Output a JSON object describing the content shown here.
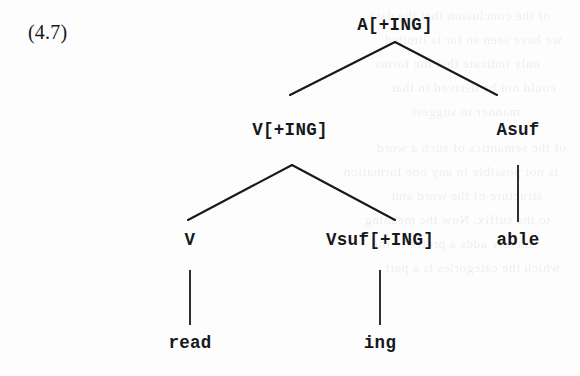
{
  "figure": {
    "number_label": "(4.7)",
    "kind": "syntactic-tree-diagram",
    "ink_color": "#16181a",
    "page_color": "#fdfdfd"
  },
  "tree": {
    "nodes": [
      {
        "id": "root",
        "label": "A[+ING]",
        "x": 395,
        "y": 25,
        "level": 0,
        "role": "root-category"
      },
      {
        "id": "v1",
        "label": "V[+ING]",
        "x": 290,
        "y": 130,
        "level": 1,
        "role": "branching-node"
      },
      {
        "id": "asuf",
        "label": "Asuf",
        "x": 518,
        "y": 130,
        "level": 1,
        "role": "suffix-node"
      },
      {
        "id": "v2",
        "label": "V",
        "x": 190,
        "y": 240,
        "level": 2,
        "role": "branching-node"
      },
      {
        "id": "vsuf",
        "label": "Vsuf[+ING]",
        "x": 380,
        "y": 240,
        "level": 2,
        "role": "suffix-node"
      },
      {
        "id": "able",
        "label": "able",
        "x": 518,
        "y": 240,
        "level": 2,
        "role": "terminal"
      },
      {
        "id": "read",
        "label": "read",
        "x": 190,
        "y": 343,
        "level": 3,
        "role": "terminal"
      },
      {
        "id": "ing",
        "label": "ing",
        "x": 380,
        "y": 343,
        "level": 3,
        "role": "terminal"
      }
    ],
    "edges": [
      {
        "from": "root",
        "to": "v1",
        "x1": 395,
        "y1": 42,
        "x2": 290,
        "y2": 95,
        "type": "branch-left"
      },
      {
        "from": "root",
        "to": "asuf",
        "x1": 395,
        "y1": 42,
        "x2": 497,
        "y2": 95,
        "type": "branch-right"
      },
      {
        "from": "v1",
        "to": "v2",
        "x1": 292,
        "y1": 165,
        "x2": 188,
        "y2": 220,
        "type": "branch-left"
      },
      {
        "from": "v1",
        "to": "vsuf",
        "x1": 292,
        "y1": 165,
        "x2": 395,
        "y2": 220,
        "type": "branch-right"
      },
      {
        "from": "asuf",
        "to": "able",
        "x1": 518,
        "y1": 165,
        "x2": 518,
        "y2": 222,
        "type": "stem"
      },
      {
        "from": "v2",
        "to": "read",
        "x1": 190,
        "y1": 270,
        "x2": 190,
        "y2": 325,
        "type": "stem"
      },
      {
        "from": "vsuf",
        "to": "ing",
        "x1": 380,
        "y1": 270,
        "x2": 380,
        "y2": 325,
        "type": "stem"
      }
    ]
  },
  "background_showthrough": {
    "description": "faint mirrored ink bleeding through from the reverse page; illegible",
    "lines": [
      {
        "text": "of the conclusion that the data",
        "x": 30,
        "y": 8
      },
      {
        "text": "we have seen so far is limited",
        "x": 18,
        "y": 32
      },
      {
        "text": "only indicate that the forms",
        "x": 40,
        "y": 56
      },
      {
        "text": "could not be derived in that",
        "x": 24,
        "y": 80
      },
      {
        "text": "manner to suggest",
        "x": 60,
        "y": 104
      },
      {
        "text": "of the semantics of such a word",
        "x": 14,
        "y": 140
      },
      {
        "text": "is not possible in any one formation",
        "x": 22,
        "y": 164
      },
      {
        "text": "structure of the word and",
        "x": 38,
        "y": 188
      },
      {
        "text": "to the suffix. Now the meaning",
        "x": 30,
        "y": 212
      },
      {
        "text": "merely adds a prefix to the",
        "x": 48,
        "y": 236
      },
      {
        "text": "which the categories is a part",
        "x": 20,
        "y": 260
      }
    ]
  }
}
